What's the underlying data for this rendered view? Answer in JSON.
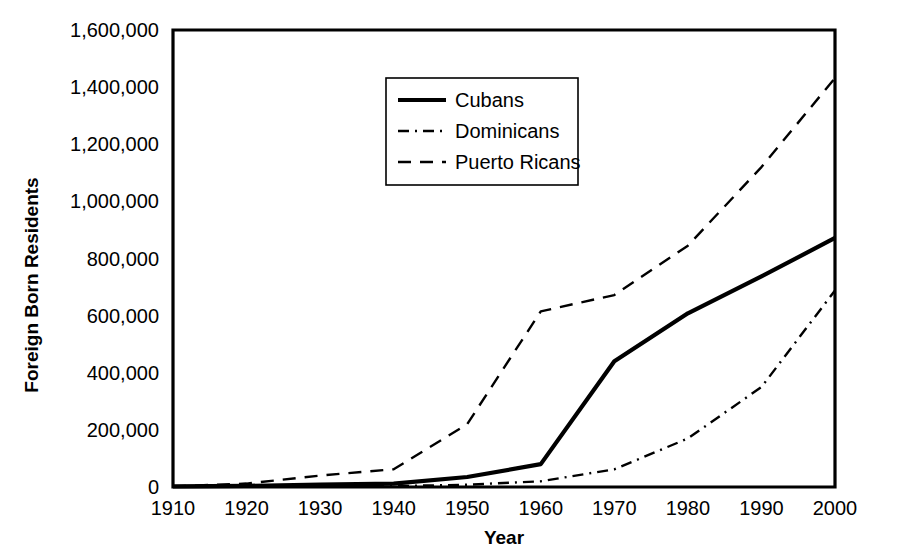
{
  "chart_data": {
    "type": "line",
    "title": "",
    "xlabel": "Year",
    "ylabel": "Foreign Born Residents",
    "x": [
      1910,
      1920,
      1930,
      1940,
      1950,
      1960,
      1970,
      1980,
      1990,
      2000
    ],
    "xtick_labels": [
      "1910",
      "1920",
      "1930",
      "1940",
      "1950",
      "1960",
      "1970",
      "1980",
      "1990",
      "2000"
    ],
    "ytick_labels": [
      "0",
      "200,000",
      "400,000",
      "600,000",
      "800,000",
      "1,000,000",
      "1,200,000",
      "1,400,000",
      "1,600,000"
    ],
    "ytick_values": [
      0,
      200000,
      400000,
      600000,
      800000,
      1000000,
      1200000,
      1400000,
      1600000
    ],
    "xlim": [
      1910,
      2000
    ],
    "ylim": [
      0,
      1600000
    ],
    "grid": false,
    "legend_position": "upper-center",
    "series": [
      {
        "name": "Cubans",
        "style": "solid",
        "color": "#000000",
        "values": [
          2000,
          4000,
          8000,
          12000,
          35000,
          80000,
          440000,
          608000,
          737000,
          872000
        ]
      },
      {
        "name": "Dominicans",
        "style": "dash-dot",
        "color": "#000000",
        "values": [
          500,
          1000,
          2000,
          3000,
          8000,
          20000,
          62000,
          170000,
          350000,
          688000
        ]
      },
      {
        "name": "Puerto Ricans",
        "style": "dashed",
        "color": "#000000",
        "values": [
          2000,
          12000,
          40000,
          62000,
          220000,
          615000,
          672000,
          845000,
          1120000,
          1432000
        ]
      }
    ]
  },
  "legend": {
    "entries": [
      "Cubans",
      "Dominicans",
      "Puerto Ricans"
    ]
  }
}
